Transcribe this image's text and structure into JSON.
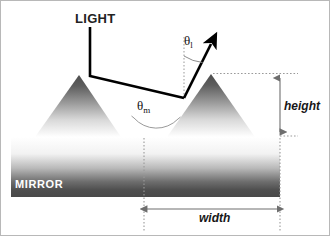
{
  "figure": {
    "width_px": 330,
    "height_px": 236,
    "background": "#ffffff",
    "border_color": "#b8b8b8"
  },
  "labels": {
    "light": "LIGHT",
    "mirror": "MIRROR",
    "height": "height",
    "width": "width",
    "theta_l_symbol": "θ",
    "theta_l_subscript": "l",
    "theta_m_symbol": "θ",
    "theta_m_subscript": "m"
  },
  "colors": {
    "ray": "#000000",
    "dotted_guide": "#9a9a9a",
    "dimension_arrow": "#6e6e6e",
    "mirror_dark": "#4a4a4a",
    "mirror_light": "#ffffff",
    "prism_dark": "#545454",
    "prism_light": "#ffffff",
    "text": "#1a1a1a",
    "mirror_text": "#ffffff"
  },
  "geometry": {
    "left_prism": {
      "apex_x": 78,
      "apex_y": 74,
      "base_left_x": 34,
      "base_right_x": 120,
      "base_y": 136
    },
    "right_prism": {
      "apex_x": 210,
      "apex_y": 73,
      "base_left_x": 166,
      "base_right_x": 254,
      "base_y": 136
    },
    "mirror_slab": {
      "x": 10,
      "y": 136,
      "width": 269,
      "height": 60
    },
    "incident_ray": {
      "x1": 89,
      "y1": 26,
      "x2": 89,
      "y2": 75,
      "x3": 183,
      "y3": 97
    },
    "reflected_ray": {
      "x1": 183,
      "y1": 97,
      "x2": 214,
      "y2": 37
    },
    "normal_dotted": {
      "x": 183,
      "y_top": 36,
      "y_bottom": 97
    },
    "height_dim": {
      "x": 279,
      "y_top": 74,
      "y_bottom": 134
    },
    "width_dim": {
      "y": 208,
      "x_left": 143,
      "x_right": 279
    },
    "theta_l_arc_deg": 27,
    "theta_m_arc_deg": 84
  }
}
